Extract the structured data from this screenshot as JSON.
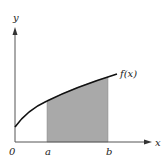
{
  "diagram": {
    "function_label": "f(x)",
    "axes": {
      "x_label": "x",
      "y_label": "y",
      "origin_label": "0"
    },
    "interval": {
      "start_label": "a",
      "end_label": "b"
    },
    "colors": {
      "shade": "#a9a9a9",
      "curve": "#111111",
      "axis": "#555555"
    }
  }
}
